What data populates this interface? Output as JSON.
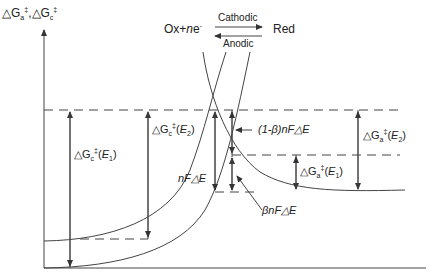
{
  "axis": {
    "y_label_a": "△G",
    "y_sub_a": "a",
    "y_sup": "‡",
    "y_sep": ",",
    "y_label_c": "△G",
    "y_sub_c": "c"
  },
  "reaction": {
    "left": "Ox+",
    "n": "n",
    "e": "e",
    "e_sup": "-",
    "forward": "Cathodic",
    "backward": "Anodic",
    "right": "Red"
  },
  "labels": {
    "dGc_E1": {
      "pre": "△G",
      "sub": "c",
      "sup": "‡",
      "arg": "(",
      "E": "E",
      "Esub": "1",
      "close": ")"
    },
    "dGc_E2": {
      "pre": "△G",
      "sub": "c",
      "sup": "‡",
      "arg": "(",
      "E": "E",
      "Esub": "2",
      "close": ")"
    },
    "dGa_E1": {
      "pre": "△G",
      "sub": "a",
      "sup": "‡",
      "arg": "(",
      "E": "E",
      "Esub": "1",
      "close": ")"
    },
    "dGa_E2": {
      "pre": "△G",
      "sub": "a",
      "sup": "‡",
      "arg": "(",
      "E": "E",
      "Esub": "2",
      "close": ")"
    },
    "one_minus_beta": "(1-β)nF△E",
    "beta_term": "βnF△E",
    "nFdE": "nF△E"
  }
}
